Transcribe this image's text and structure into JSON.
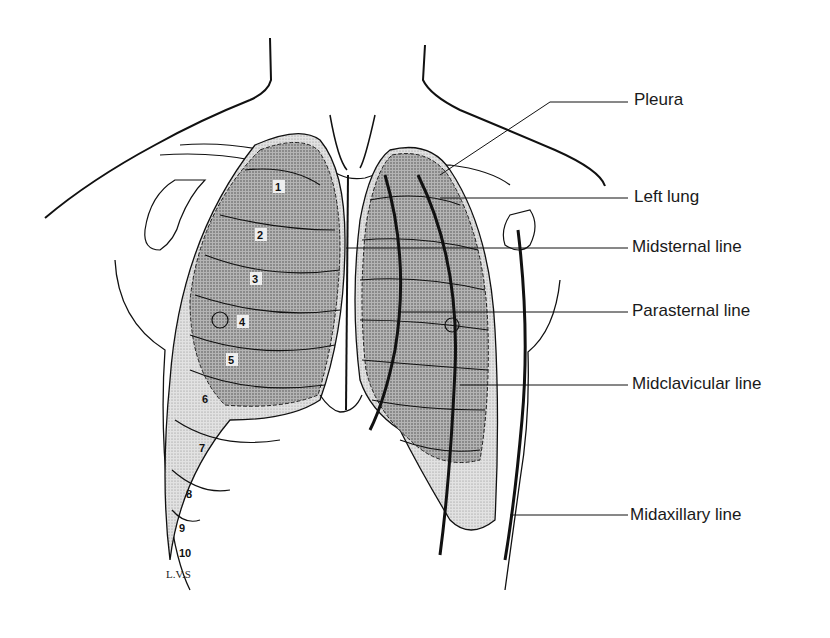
{
  "figure": {
    "colors": {
      "ink": "#111111",
      "lung_fill": "#8f8f8f",
      "pleura_fill": "#c9c9c9",
      "background": "#ffffff"
    }
  },
  "labels": [
    {
      "id": "pleura",
      "text": "Pleura"
    },
    {
      "id": "left-lung",
      "text": "Left lung"
    },
    {
      "id": "midsternal-line",
      "text": "Midsternal line"
    },
    {
      "id": "parasternal-line",
      "text": "Parasternal line"
    },
    {
      "id": "midclavicular-line",
      "text": "Midclavicular line"
    },
    {
      "id": "midaxillary-line",
      "text": "Midaxillary line"
    }
  ],
  "ribs": [
    "1",
    "2",
    "3",
    "4",
    "5",
    "6",
    "7",
    "8",
    "9",
    "10"
  ],
  "signature": "L.V.S"
}
